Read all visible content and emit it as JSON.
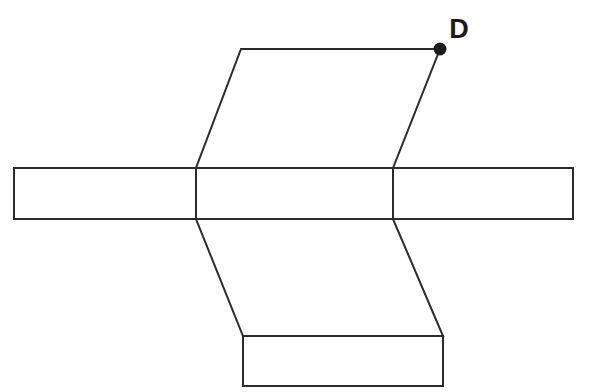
{
  "figure": {
    "canvas": {
      "width": 591,
      "height": 392,
      "background": "#ffffff"
    },
    "style": {
      "stroke_color": "#2b2b2b",
      "stroke_width": 2,
      "face_fill": "#ffffff",
      "dot_color": "#1c1c1c",
      "label_color": "#1c1c1c"
    },
    "faces": [
      {
        "name": "upper-flap",
        "shape": "parallelogram",
        "points": "241,49 440,49 393,168 196,168"
      },
      {
        "name": "horizontal-band-left",
        "shape": "rectangle",
        "points": "14,168 196,168 196,219 14,219"
      },
      {
        "name": "horizontal-band-center",
        "shape": "rectangle",
        "points": "196,168 393,168 393,219 196,219"
      },
      {
        "name": "horizontal-band-right",
        "shape": "rectangle",
        "points": "393,168 573,168 573,219 393,219"
      },
      {
        "name": "lower-flap",
        "shape": "parallelogram",
        "points": "196,219 393,219 443,336 243,336"
      },
      {
        "name": "bottom-flap",
        "shape": "rectangle",
        "points": "243,336 443,336 443,386 243,386"
      }
    ],
    "creases": [
      {
        "name": "crease-left-vertical",
        "points": "196,168 196,219"
      },
      {
        "name": "crease-right-vertical",
        "points": "393,168 393,219"
      },
      {
        "name": "crease-band-top",
        "points": "14,168 573,168"
      },
      {
        "name": "crease-band-bottom",
        "points": "14,219 573,219"
      },
      {
        "name": "crease-bottom-flap-top",
        "points": "243,336 443,336"
      }
    ],
    "vertices": [
      {
        "name": "point-d",
        "label": "D",
        "cx": 440,
        "cy": 49,
        "r": 6.5,
        "label_x": 459,
        "label_y": 38
      }
    ]
  }
}
